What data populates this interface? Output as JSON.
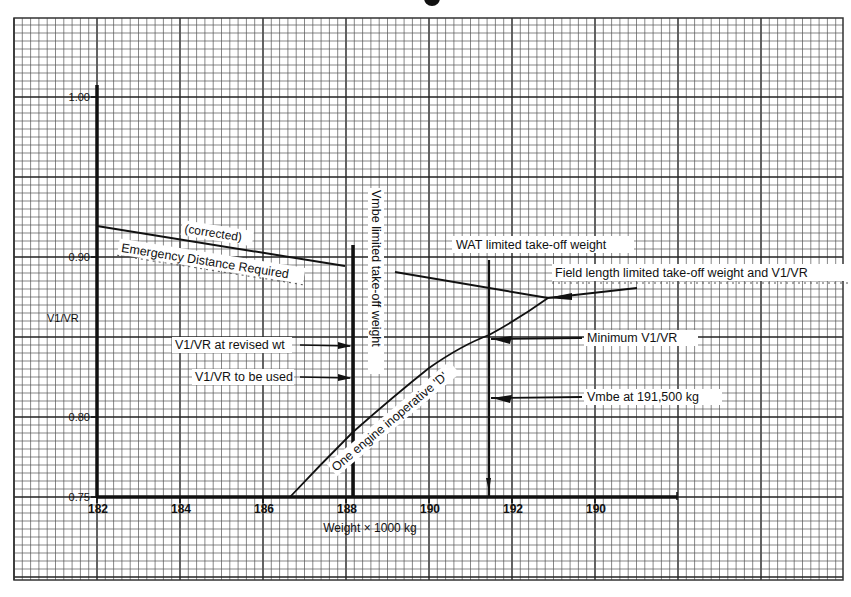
{
  "colors": {
    "paper": "#ffffff",
    "grid_minor": "#555555",
    "grid_major": "#222222",
    "ink": "#111111",
    "label_bg": "#ffffff"
  },
  "chart_data": {
    "type": "line",
    "title": "",
    "xlabel": "Weight × 1000 kg",
    "ylabel": "V1/VR",
    "xlim": [
      180,
      198
    ],
    "ylim": [
      0.75,
      1.0
    ],
    "x_ticks": [
      182,
      184,
      186,
      188,
      190,
      192,
      194
    ],
    "x_tick_labels": [
      "182",
      "184",
      "186",
      "188",
      "190",
      "192",
      "190"
    ],
    "y_ticks": [
      0.75,
      0.8,
      0.9,
      1.0
    ],
    "y_tick_labels": [
      "0.75",
      "0.80",
      "0.90",
      "1.00"
    ],
    "grid": true,
    "legend_position": "none",
    "series": [
      {
        "name": "Emergency Distance Required (corrected)",
        "x": [
          182.0,
          188.0
        ],
        "y": [
          0.92,
          0.895
        ]
      },
      {
        "name": "Field length limited take-off weight and V1/VR",
        "x": [
          189.2,
          192.9,
          195.0
        ],
        "y": [
          0.89,
          0.874,
          0.88
        ]
      },
      {
        "name": "One engine inoperative 'D'",
        "x": [
          186.7,
          188.2,
          190.0,
          191.5,
          192.9
        ],
        "y": [
          0.75,
          0.791,
          0.831,
          0.851,
          0.874
        ]
      },
      {
        "name": "Vmbe limited take-off weight",
        "x": [
          188.2,
          188.2
        ],
        "y": [
          0.75,
          0.907
        ]
      },
      {
        "name": "WAT limited take-off weight",
        "x": [
          191.5,
          191.5
        ],
        "y": [
          0.75,
          0.897
        ]
      }
    ],
    "annotations": [
      {
        "text": "(corrected)",
        "x": 185.2,
        "y": 0.912
      },
      {
        "text": "Emergency Distance Required",
        "x": 185.0,
        "y": 0.898
      },
      {
        "text": "Vmbe limited take-off weight",
        "x": 188.5,
        "y": 0.88,
        "rotation": 90
      },
      {
        "text": "WAT limited take-off weight",
        "x": 192.0,
        "y": 0.905
      },
      {
        "text": "Field length limited take-off weight and V1/VR",
        "x": 195.0,
        "y": 0.889
      },
      {
        "text": "V1/VR at revised wt",
        "x": 185.0,
        "y": 0.848,
        "arrow_to": [
          188.2,
          0.847
        ]
      },
      {
        "text": "V1/VR to be used",
        "x": 185.0,
        "y": 0.834,
        "arrow_to": [
          188.2,
          0.833
        ]
      },
      {
        "text": "Minimum V1/VR",
        "x": 194.0,
        "y": 0.851,
        "arrow_to": [
          191.5,
          0.851
        ]
      },
      {
        "text": "Vmbe at 191,500 kg",
        "x": 194.0,
        "y": 0.812,
        "arrow_to": [
          191.5,
          0.812
        ]
      },
      {
        "text": "One engine inoperative 'D'",
        "x": 189.5,
        "y": 0.8,
        "rotation": -40
      }
    ]
  },
  "labels": {
    "y_axis_title": "V1/VR",
    "x_axis_title": "Weight × 1000 kg",
    "corrected": "(corrected)",
    "emergency": "Emergency Distance Required",
    "vmbe_limited": "Vmbe limited take-off weight",
    "wat_limited": "WAT limited take-off weight",
    "field_length": "Field length limited take-off weight and V1/VR",
    "v1vr_revised": "V1/VR at revised wt",
    "v1vr_used": "V1/VR to be used",
    "min_v1vr": "Minimum V1/VR",
    "vmbe_191": "Vmbe at 191,500 kg",
    "one_engine": "One engine inoperative 'D'",
    "y_ticks": [
      "1.00",
      "0.90",
      "0.80",
      "0.75"
    ],
    "x_ticks": [
      "182",
      "184",
      "186",
      "188",
      "190",
      "192",
      "190"
    ]
  }
}
